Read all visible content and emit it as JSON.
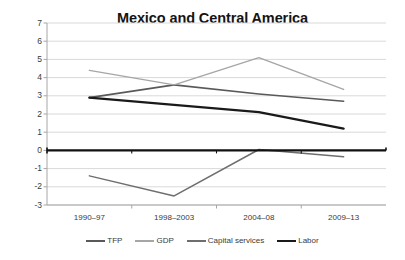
{
  "chart_data": {
    "type": "line",
    "title": "Mexico and Central America",
    "xlabel": "",
    "ylabel": "",
    "categories": [
      "1990–97",
      "1998–2003",
      "2004–08",
      "2009–13"
    ],
    "ylim": [
      -3,
      7
    ],
    "ytick_labels": [
      "7",
      "6",
      "5",
      "4",
      "3",
      "2",
      "1",
      "0",
      "-1",
      "-2",
      "-3"
    ],
    "ytick_values": [
      7,
      6,
      5,
      4,
      3,
      2,
      1,
      0,
      -1,
      -2,
      -3
    ],
    "grid": true,
    "legend_position": "bottom",
    "zero_line": true,
    "series": [
      {
        "name": "TFP",
        "color": "#595959",
        "width": 1.6,
        "values": [
          2.9,
          3.6,
          3.1,
          2.7
        ]
      },
      {
        "name": "GDP",
        "color": "#a6a6a6",
        "width": 1.4,
        "values": [
          4.4,
          3.6,
          5.1,
          3.35
        ]
      },
      {
        "name": "Capital services",
        "color": "#6e6e6e",
        "width": 1.5,
        "values": [
          -1.4,
          -2.5,
          0.05,
          -0.35
        ]
      },
      {
        "name": "Labor",
        "color": "#1a1a1a",
        "width": 2.3,
        "values": [
          2.9,
          2.5,
          2.1,
          1.2
        ]
      }
    ]
  },
  "legend": {
    "items": [
      {
        "label": "TFP",
        "color": "#595959",
        "width": 2.2
      },
      {
        "label": "GDP",
        "color": "#a6a6a6",
        "width": 2.0
      },
      {
        "label": "Capital services",
        "color": "#6e6e6e",
        "width": 2.1
      },
      {
        "label": "Labor",
        "color": "#1a1a1a",
        "width": 2.8
      }
    ]
  },
  "colors": {
    "grid": "#d9d9d9",
    "axis": "#a6a6a6",
    "zero_line": "#111111",
    "text": "#3a3a3a",
    "title": "#141414",
    "background": "#ffffff"
  }
}
